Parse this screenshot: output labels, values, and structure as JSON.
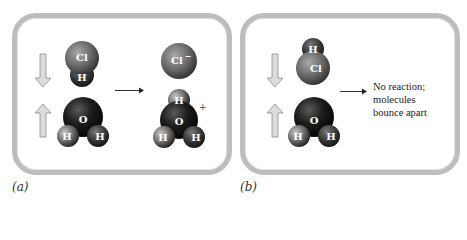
{
  "panels": {
    "a": {
      "caption": "(a)",
      "reactants": {
        "molecule1": {
          "name": "HCl",
          "atoms": [
            "Cl",
            "H"
          ],
          "orientation": "H facing down toward water"
        },
        "molecule2": {
          "name": "H2O",
          "atoms": [
            "O",
            "H",
            "H"
          ]
        }
      },
      "products": {
        "ion1": {
          "name": "Cl-",
          "label": "Cl⁻"
        },
        "ion2": {
          "name": "H3O+",
          "atoms": [
            "H",
            "O",
            "H",
            "H"
          ],
          "charge": "+"
        }
      },
      "arrows": {
        "top": "down",
        "bottom": "up",
        "reaction": "right"
      }
    },
    "b": {
      "caption": "(b)",
      "reactants": {
        "molecule1": {
          "name": "HCl",
          "atoms": [
            "H",
            "Cl"
          ],
          "orientation": "Cl facing down toward water"
        },
        "molecule2": {
          "name": "H2O",
          "atoms": [
            "O",
            "H",
            "H"
          ]
        }
      },
      "result_text": [
        "No reaction;",
        "molecules",
        "bounce apart"
      ],
      "arrows": {
        "top": "down",
        "bottom": "up",
        "reaction": "right"
      }
    }
  },
  "labels": {
    "cl": "Cl",
    "cl_minus": "Cl",
    "minus": "−",
    "h": "H",
    "o": "O",
    "plus": "+"
  },
  "colors": {
    "border": "#bdbdbd",
    "cl_sphere": "#6e6e6e",
    "o_sphere": "#1a1a1a",
    "h_sphere": "#8a8a8a",
    "collision_arrow": "#d8d8d8"
  }
}
